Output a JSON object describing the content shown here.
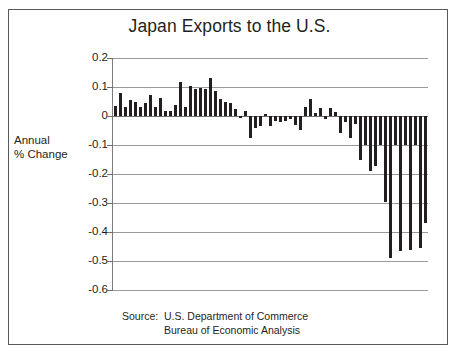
{
  "figure": {
    "title": "Japan Exports to the U.S.",
    "axis_caption_line1": "Annual",
    "axis_caption_line2": "% Change",
    "source_label": "Source:",
    "source_line1": "U.S. Department of Commerce",
    "source_line2": "Bureau of Economic Analysis",
    "bar_color": "#231f20",
    "grid_color": "#9a9a9a",
    "border_color": "#58595b",
    "text_color": "#231f20"
  },
  "chart_data": {
    "type": "bar",
    "title": "Japan Exports to the U.S.",
    "xlabel": "",
    "ylabel": "Annual % Change",
    "ylim": [
      -0.6,
      0.2
    ],
    "ytick_labels": [
      "0.2",
      "0.1",
      "0",
      "-0.1",
      "-0.2",
      "-0.3",
      "-0.4",
      "-0.5",
      "-0.6"
    ],
    "ytick_values": [
      0.2,
      0.1,
      0,
      -0.1,
      -0.2,
      -0.3,
      -0.4,
      -0.5,
      -0.6
    ],
    "grid": true,
    "legend": "none",
    "source": "U.S. Department of Commerce, Bureau of Economic Analysis",
    "categories": [
      "1",
      "2",
      "3",
      "4",
      "5",
      "6",
      "7",
      "8",
      "9",
      "10",
      "11",
      "12",
      "13",
      "14",
      "15",
      "16",
      "17",
      "18",
      "19",
      "20",
      "21",
      "22",
      "23",
      "24",
      "25",
      "26",
      "27",
      "28",
      "29",
      "30",
      "31",
      "32",
      "33",
      "34",
      "35",
      "36",
      "37",
      "38",
      "39",
      "40",
      "41",
      "42",
      "43",
      "44",
      "45",
      "46",
      "47",
      "48",
      "49",
      "50",
      "51",
      "52",
      "53",
      "54",
      "55",
      "56",
      "57",
      "58",
      "59",
      "60",
      "61",
      "62",
      "63"
    ],
    "values": [
      0.035,
      0.078,
      0.03,
      0.055,
      0.047,
      0.03,
      0.045,
      0.072,
      0.03,
      0.062,
      0.016,
      0.016,
      0.039,
      0.118,
      0.031,
      0.102,
      0.093,
      0.095,
      0.094,
      0.132,
      0.085,
      0.06,
      0.047,
      0.044,
      0.024,
      -0.006,
      0.016,
      -0.076,
      -0.04,
      -0.034,
      0.008,
      -0.033,
      -0.018,
      -0.02,
      -0.017,
      -0.01,
      -0.03,
      -0.048,
      0.03,
      0.06,
      0.012,
      0.028,
      -0.01,
      0.026,
      0.013,
      -0.058,
      -0.02,
      -0.076,
      -0.028,
      -0.152,
      -0.1,
      -0.19,
      -0.172,
      -0.1,
      -0.295,
      -0.49,
      -0.1,
      -0.466,
      -0.1,
      -0.462,
      -0.1,
      -0.455,
      -0.368
    ]
  }
}
